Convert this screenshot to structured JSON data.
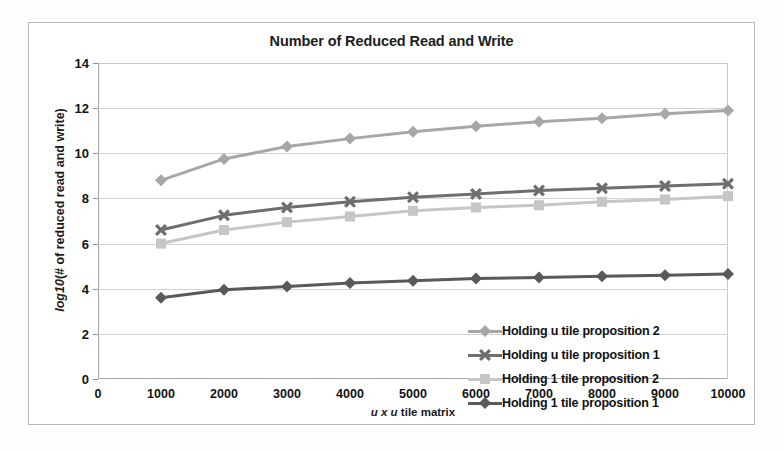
{
  "chart_data": {
    "type": "line",
    "title": "Number of Reduced Read and Write",
    "xlabel": "u x u tile matrix",
    "ylabel": "log10(# of reduced read and write)",
    "grid": true,
    "legend_position": "inside-bottom-right",
    "xlim": [
      0,
      10000
    ],
    "ylim": [
      0,
      14
    ],
    "x_ticks": [
      "0",
      "1000",
      "2000",
      "3000",
      "4000",
      "5000",
      "6000",
      "7000",
      "8000",
      "9000",
      "10000"
    ],
    "y_ticks": [
      "0",
      "2",
      "4",
      "6",
      "8",
      "10",
      "12",
      "14"
    ],
    "x": [
      1000,
      2000,
      3000,
      4000,
      5000,
      6000,
      7000,
      8000,
      9000,
      10000
    ],
    "series": [
      {
        "name": "Holding u tile proposition 2",
        "marker": "diamond",
        "color": "#a7a7a7",
        "values": [
          8.8,
          9.75,
          10.3,
          10.65,
          10.95,
          11.2,
          11.4,
          11.55,
          11.75,
          11.9
        ]
      },
      {
        "name": "Holding u tile proposition 1",
        "marker": "cross",
        "color": "#6e6e6e",
        "values": [
          6.6,
          7.25,
          7.6,
          7.85,
          8.05,
          8.2,
          8.35,
          8.45,
          8.55,
          8.65
        ]
      },
      {
        "name": "Holding 1 tile proposition 2",
        "marker": "square",
        "color": "#c6c6c6",
        "values": [
          6.0,
          6.6,
          6.95,
          7.2,
          7.45,
          7.6,
          7.7,
          7.85,
          7.95,
          8.1
        ]
      },
      {
        "name": "Holding 1 tile  proposition 1",
        "marker": "diamond",
        "color": "#595959",
        "values": [
          3.6,
          3.95,
          4.1,
          4.25,
          4.35,
          4.45,
          4.5,
          4.55,
          4.6,
          4.65
        ]
      }
    ]
  },
  "legend": {
    "items": [
      {
        "label": "Holding u tile proposition 2",
        "marker": "diamond",
        "color": "#a7a7a7"
      },
      {
        "label": "Holding u tile proposition 1",
        "marker": "cross",
        "color": "#6e6e6e"
      },
      {
        "label": "Holding 1 tile proposition 2",
        "marker": "square",
        "color": "#c6c6c6"
      },
      {
        "label": "Holding 1 tile  proposition 1",
        "marker": "diamond",
        "color": "#595959"
      }
    ]
  },
  "axis_label_parts": {
    "y_italic": "log10",
    "y_rest": "(# of reduced read and write)",
    "x_italic": "u x u",
    "x_rest": " tile matrix"
  }
}
